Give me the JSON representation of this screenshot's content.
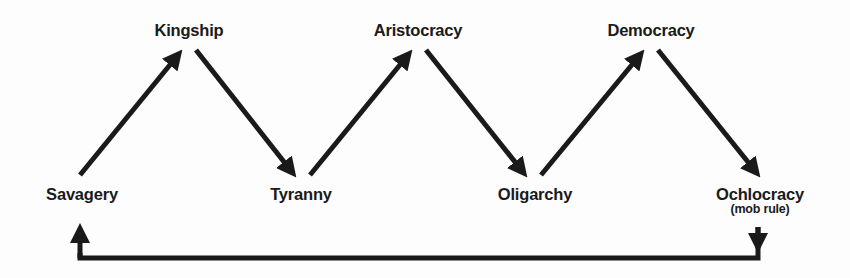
{
  "diagram": {
    "title": "",
    "type": "cycle-of-governments",
    "nodes": [
      {
        "id": "savagery",
        "label": "Savagery",
        "sublabel": ""
      },
      {
        "id": "kingship",
        "label": "Kingship",
        "sublabel": ""
      },
      {
        "id": "tyranny",
        "label": "Tyranny",
        "sublabel": ""
      },
      {
        "id": "aristocracy",
        "label": "Aristocracy",
        "sublabel": ""
      },
      {
        "id": "oligarchy",
        "label": "Oligarchy",
        "sublabel": ""
      },
      {
        "id": "democracy",
        "label": "Democracy",
        "sublabel": ""
      },
      {
        "id": "ochlocracy",
        "label": "Ochlocracy",
        "sublabel": "(mob rule)"
      }
    ],
    "edges": [
      {
        "from": "savagery",
        "to": "kingship"
      },
      {
        "from": "kingship",
        "to": "tyranny"
      },
      {
        "from": "tyranny",
        "to": "aristocracy"
      },
      {
        "from": "aristocracy",
        "to": "oligarchy"
      },
      {
        "from": "oligarchy",
        "to": "democracy"
      },
      {
        "from": "democracy",
        "to": "ochlocracy"
      },
      {
        "from": "ochlocracy",
        "to": "savagery",
        "style": "return-loop"
      }
    ],
    "colors": {
      "ink": "#1a1a1a",
      "background": "#fdfdfd"
    }
  }
}
